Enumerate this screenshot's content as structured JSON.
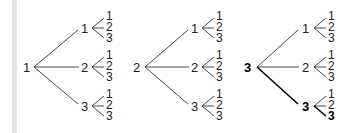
{
  "diagram": {
    "type": "tree-diagram",
    "trees": [
      {
        "root": "1",
        "root_bold": false,
        "children": [
          {
            "label": "1",
            "bold": false,
            "leaves": [
              {
                "label": "1",
                "bold": false
              },
              {
                "label": "2",
                "bold": false
              },
              {
                "label": "3",
                "bold": false
              }
            ]
          },
          {
            "label": "2",
            "bold": false,
            "leaves": [
              {
                "label": "1",
                "bold": false
              },
              {
                "label": "2",
                "bold": false
              },
              {
                "label": "3",
                "bold": false
              }
            ]
          },
          {
            "label": "3",
            "bold": false,
            "leaves": [
              {
                "label": "1",
                "bold": false
              },
              {
                "label": "2",
                "bold": false
              },
              {
                "label": "3",
                "bold": false
              }
            ]
          }
        ]
      },
      {
        "root": "2",
        "root_bold": false,
        "children": [
          {
            "label": "1",
            "bold": false,
            "leaves": [
              {
                "label": "1",
                "bold": false
              },
              {
                "label": "2",
                "bold": false
              },
              {
                "label": "3",
                "bold": false
              }
            ]
          },
          {
            "label": "2",
            "bold": false,
            "leaves": [
              {
                "label": "1",
                "bold": false
              },
              {
                "label": "2",
                "bold": false
              },
              {
                "label": "3",
                "bold": false
              }
            ]
          },
          {
            "label": "3",
            "bold": false,
            "leaves": [
              {
                "label": "1",
                "bold": false
              },
              {
                "label": "2",
                "bold": false
              },
              {
                "label": "3",
                "bold": false
              }
            ]
          }
        ]
      },
      {
        "root": "3",
        "root_bold": true,
        "children": [
          {
            "label": "1",
            "bold": false,
            "leaves": [
              {
                "label": "1",
                "bold": false
              },
              {
                "label": "2",
                "bold": false
              },
              {
                "label": "3",
                "bold": false
              }
            ]
          },
          {
            "label": "2",
            "bold": false,
            "leaves": [
              {
                "label": "1",
                "bold": false
              },
              {
                "label": "2",
                "bold": false
              },
              {
                "label": "3",
                "bold": false
              }
            ]
          },
          {
            "label": "3",
            "bold": true,
            "leaves": [
              {
                "label": "1",
                "bold": false
              },
              {
                "label": "2",
                "bold": false
              },
              {
                "label": "3",
                "bold": true
              }
            ]
          }
        ]
      }
    ]
  }
}
